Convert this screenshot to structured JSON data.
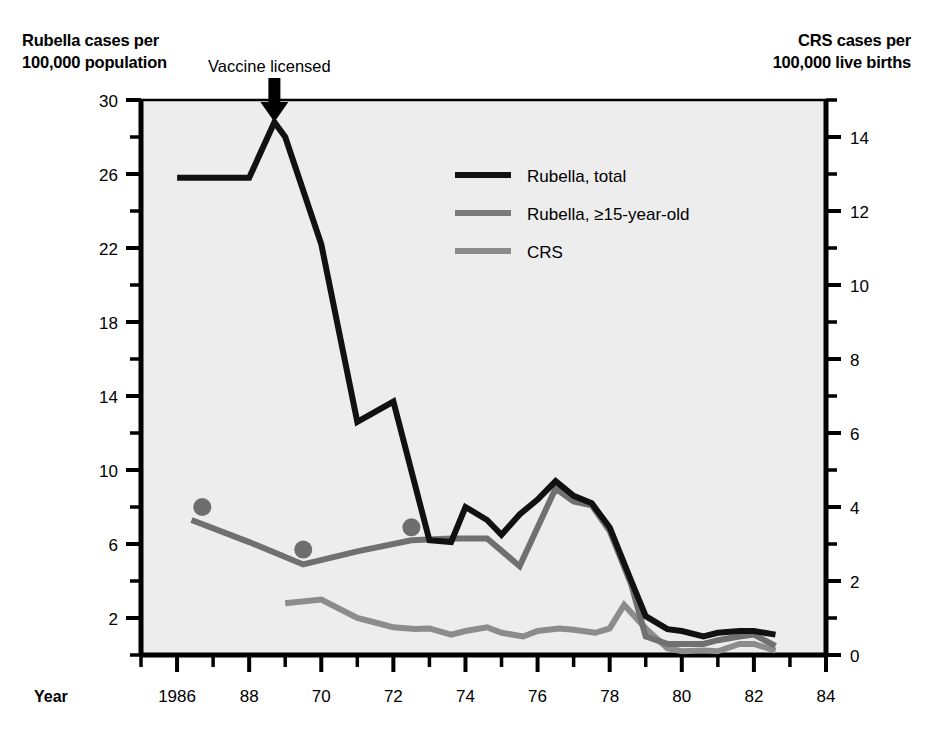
{
  "figure": {
    "left_axis_title_line1": "Rubella cases per",
    "left_axis_title_line2": "100,000 population",
    "right_axis_title_line1": "CRS cases per",
    "right_axis_title_line2": "100,000 live births",
    "annotation": "Vaccine licensed",
    "x_axis_name": "Year",
    "plot_background": "#ededed",
    "axis_color": "#000000"
  },
  "legend": {
    "position": "inside-top-right",
    "entries": [
      {
        "label": "Rubella, total",
        "color": "#111111",
        "thickness": 6
      },
      {
        "label": "Rubella, ≥15-year-old",
        "color": "#7a7a7a",
        "thickness": 6
      },
      {
        "label": "CRS",
        "color": "#8c8c8c",
        "thickness": 6
      }
    ]
  },
  "chart_data": {
    "type": "line",
    "title": "",
    "xlabel": "Year",
    "ylabel": "Rubella cases per 100,000 population",
    "y2label": "CRS cases per 100,000 live births",
    "grid": false,
    "xlim": [
      1965,
      1984
    ],
    "ylim": [
      0,
      30
    ],
    "y2lim": [
      0,
      15
    ],
    "x_ticks": [
      1966,
      1968,
      1970,
      1972,
      1974,
      1976,
      1978,
      1980,
      1982,
      1984
    ],
    "x_tick_labels": [
      "1986",
      "88",
      "70",
      "72",
      "74",
      "76",
      "78",
      "80",
      "82",
      "84"
    ],
    "x_minor_tick_step": 1,
    "y_ticks": [
      2,
      6,
      10,
      14,
      18,
      22,
      26,
      30
    ],
    "y_tick_labels": [
      "2",
      "6",
      "10",
      "14",
      "18",
      "22",
      "26",
      "30"
    ],
    "y_minor_tick_step": 2,
    "y2_ticks": [
      0,
      2,
      4,
      6,
      8,
      10,
      12,
      14
    ],
    "y2_tick_labels": [
      "0",
      "2",
      "4",
      "6",
      "8",
      "10",
      "12",
      "14"
    ],
    "y2_minor_tick_step": 1,
    "annotations": [
      {
        "text": "Vaccine licensed",
        "x": 1968.7,
        "type": "down-arrow"
      }
    ],
    "series": [
      {
        "name": "Rubella, total",
        "axis": "left",
        "color": "#111111",
        "x": [
          1966,
          1967,
          1968,
          1968.7,
          1969,
          1970,
          1971,
          1972,
          1973,
          1973.6,
          1974,
          1974.6,
          1975,
          1975.5,
          1976,
          1976.5,
          1977,
          1977.5,
          1978,
          1978.6,
          1979,
          1979.6,
          1980,
          1980.6,
          1981,
          1981.6,
          1982,
          1982.6
        ],
        "y": [
          25.8,
          25.8,
          25.8,
          28.8,
          28.0,
          22.2,
          12.6,
          13.7,
          6.2,
          6.1,
          8.0,
          7.3,
          6.5,
          7.6,
          8.4,
          9.4,
          8.6,
          8.2,
          6.9,
          4.0,
          2.1,
          1.4,
          1.3,
          1.0,
          1.2,
          1.3,
          1.3,
          1.1
        ]
      },
      {
        "name": "Rubella, ≥15-year-old",
        "axis": "left",
        "color": "#707070",
        "x": [
          1966.4,
          1968,
          1969.5,
          1971,
          1972.5,
          1973.6,
          1974.6,
          1975.5,
          1976.5,
          1977,
          1977.5,
          1978,
          1978.6,
          1979,
          1979.6,
          1980,
          1980.6,
          1981,
          1981.6,
          1982,
          1982.6
        ],
        "y": [
          7.3,
          6.1,
          4.9,
          5.6,
          6.2,
          6.3,
          6.3,
          4.8,
          9.0,
          8.3,
          8.1,
          6.7,
          3.8,
          1.0,
          0.6,
          0.6,
          0.6,
          0.8,
          1.0,
          1.1,
          0.5
        ]
      },
      {
        "name": "CRS",
        "axis": "right",
        "color": "#8c8c8c",
        "x": [
          1969,
          1970,
          1971,
          1971.6,
          1972,
          1972.6,
          1973,
          1973.6,
          1974,
          1974.6,
          1975,
          1975.6,
          1976,
          1976.6,
          1977,
          1977.6,
          1978,
          1978.4,
          1979,
          1979.6,
          1980,
          1980.6,
          1981,
          1981.6,
          1982,
          1982.6
        ],
        "y": [
          1.4,
          1.5,
          1.0,
          0.85,
          0.75,
          0.7,
          0.72,
          0.55,
          0.65,
          0.75,
          0.6,
          0.5,
          0.65,
          0.72,
          0.68,
          0.6,
          0.72,
          1.35,
          0.72,
          0.18,
          0.1,
          0.12,
          0.1,
          0.3,
          0.3,
          0.12
        ]
      }
    ],
    "points": [
      {
        "series": "CRS-marker",
        "x": 1966.7,
        "y": 8.0,
        "axis": "left",
        "color": "#6e6e6e",
        "radius": 9
      },
      {
        "series": "CRS-marker",
        "x": 1969.5,
        "y": 5.7,
        "axis": "left",
        "color": "#6e6e6e",
        "radius": 9
      },
      {
        "series": "CRS-marker",
        "x": 1972.5,
        "y": 6.9,
        "axis": "left",
        "color": "#6e6e6e",
        "radius": 9
      }
    ]
  }
}
